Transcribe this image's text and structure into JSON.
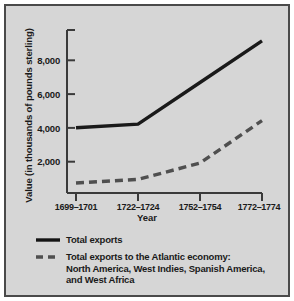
{
  "figure": {
    "background_color": "#d6d6d6",
    "border_color": "#4a4a4a",
    "ink_color": "#1a1a1a"
  },
  "axes": {
    "ylabel": "Value (in thousands of pounds sterling)",
    "xlabel": "Year",
    "ytick_labels": [
      "2,000",
      "4,000",
      "6,000",
      "8,000"
    ],
    "xtick_labels": [
      "1699–1701",
      "1722–1724",
      "1752–1754",
      "1772–1774"
    ]
  },
  "legend": {
    "items": [
      {
        "style": "solid",
        "lines": [
          "Total exports"
        ]
      },
      {
        "style": "dashed",
        "lines": [
          "Total exports to the Atlantic economy:",
          "North America, West Indies, Spanish America,",
          "and West Africa"
        ]
      }
    ]
  },
  "chart_data": {
    "type": "line",
    "title": "",
    "xlabel": "Year",
    "ylabel": "Value (in thousands of pounds sterling)",
    "categories": [
      "1699–1701",
      "1722–1724",
      "1752–1754",
      "1772–1774"
    ],
    "ylim": [
      0,
      9000
    ],
    "yticks": [
      2000,
      4000,
      6000,
      8000
    ],
    "grid": false,
    "legend_position": "below-axes",
    "series": [
      {
        "name": "Total exports",
        "style": "solid",
        "color": "#1a1a1a",
        "values": [
          3600,
          3800,
          6100,
          8400
        ]
      },
      {
        "name": "Total exports to the Atlantic economy: North America, West Indies, Spanish America, and West Africa",
        "style": "dashed",
        "color": "#4f4f4f",
        "values": [
          550,
          750,
          1650,
          4000
        ]
      }
    ]
  }
}
